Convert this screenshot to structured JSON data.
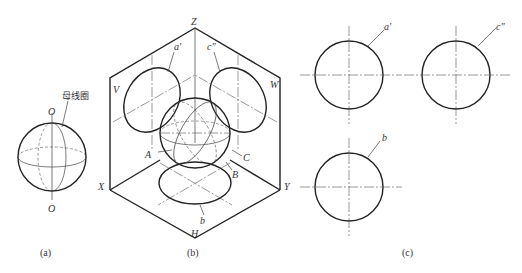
{
  "figure": {
    "panel_a": {
      "caption": "(a)",
      "top_pole_label": "O",
      "bottom_pole_label": "O",
      "annotation": "母线圈"
    },
    "panel_b": {
      "caption": "(b)",
      "axis_labels": {
        "z": "Z",
        "x": "X",
        "y": "Y"
      },
      "plane_labels": {
        "v": "V",
        "w": "W",
        "h": "H"
      },
      "projection_labels": {
        "front": "a'",
        "side": "c\"",
        "top": "b"
      },
      "circle_labels": {
        "a": "A",
        "b": "B",
        "c": "C"
      }
    },
    "panel_c": {
      "caption": "(c)",
      "front_view_label": "a'",
      "side_view_label": "c\"",
      "top_view_label": "b"
    }
  }
}
